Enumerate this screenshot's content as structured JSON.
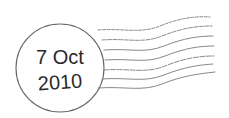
{
  "postmark": {
    "date_line_1": "7 Oct",
    "date_line_2": "2010",
    "ink_color": "#555555",
    "wave_line_count": 7
  }
}
